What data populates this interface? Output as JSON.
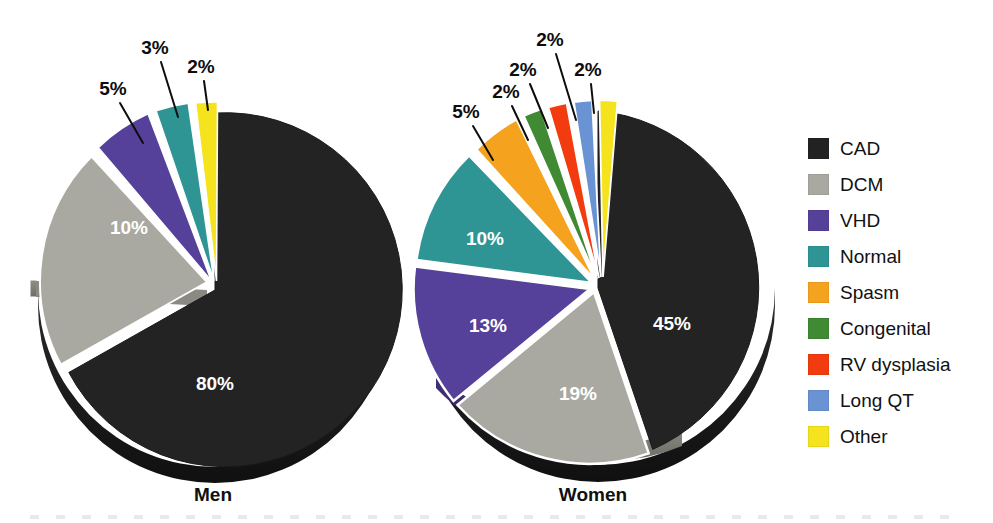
{
  "chart_data": {
    "type": "pie",
    "title": "",
    "subtitle": "",
    "xlabel": "",
    "ylabel": "",
    "legend_position": "right",
    "grid": false,
    "categories": [
      "CAD",
      "DCM",
      "VHD",
      "Normal",
      "Spasm",
      "Congenital",
      "RV dysplasia",
      "Long QT",
      "Other"
    ],
    "colors": [
      "#222222",
      "#a9a9a1",
      "#55409a",
      "#2e9594",
      "#f5a31e",
      "#3f8a33",
      "#f23c10",
      "#6a93d4",
      "#f4e31d"
    ],
    "units": "percent",
    "charts": [
      {
        "name": "Men",
        "title": "Men",
        "categories": [
          "CAD",
          "DCM",
          "VHD",
          "Normal",
          "Other"
        ],
        "values": [
          80,
          10,
          5,
          3,
          2
        ],
        "labels": [
          "80%",
          "10%",
          "5%",
          "3%",
          "2%"
        ]
      },
      {
        "name": "Women",
        "title": "Women",
        "categories": [
          "CAD",
          "DCM",
          "VHD",
          "Normal",
          "Spasm",
          "Congenital",
          "RV dysplasia",
          "Long QT",
          "Other"
        ],
        "values": [
          45,
          19,
          13,
          10,
          5,
          2,
          2,
          2,
          2
        ],
        "labels": [
          "45%",
          "19%",
          "13%",
          "10%",
          "5%",
          "2%",
          "2%",
          "2%",
          "2%"
        ]
      }
    ]
  },
  "men": {
    "title": "Men",
    "labels": {
      "cad": "80%",
      "dcm": "10%",
      "vhd": "5%",
      "normal": "3%",
      "other": "2%"
    }
  },
  "women": {
    "title": "Women",
    "labels": {
      "cad": "45%",
      "dcm": "19%",
      "vhd": "13%",
      "normal": "10%",
      "spasm": "5%",
      "congenital": "2%",
      "rv_dysplasia": "2%",
      "long_qt": "2%",
      "other": "2%"
    }
  },
  "legend": {
    "items": [
      {
        "label": "CAD",
        "color": "#222222"
      },
      {
        "label": "DCM",
        "color": "#a9a9a1"
      },
      {
        "label": "VHD",
        "color": "#55409a"
      },
      {
        "label": "Normal",
        "color": "#2e9594"
      },
      {
        "label": "Spasm",
        "color": "#f5a31e"
      },
      {
        "label": "Congenital",
        "color": "#3f8a33"
      },
      {
        "label": "RV dysplasia",
        "color": "#f23c10"
      },
      {
        "label": "Long QT",
        "color": "#6a93d4"
      },
      {
        "label": "Other",
        "color": "#f4e31d"
      }
    ]
  }
}
